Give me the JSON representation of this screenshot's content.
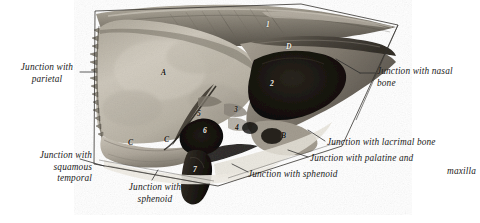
{
  "plate": {
    "title": "Ethmoid bone, lateral aspect",
    "caption_labels": [
      {
        "id": "junction-parietal",
        "text": "Junction with\nparietal"
      },
      {
        "id": "junction-squamous-temporal",
        "text": "Junction with\nsquamous\ntemporal"
      },
      {
        "id": "junction-sphenoid-bottom",
        "text": "Junction with\nsphenoid"
      },
      {
        "id": "junction-nasal-bone",
        "text": "Junction with nasal\nbone"
      },
      {
        "id": "junction-lacrimal-bone",
        "text": "Junction with lacrimal bone"
      },
      {
        "id": "junction-palatine-maxilla",
        "text": "Junction with palatine and"
      },
      {
        "id": "junction-palatine-maxilla-cont",
        "text": "maxilla"
      },
      {
        "id": "junction-sphenoid-right",
        "text": "Junction with sphenoid"
      }
    ],
    "markers": [
      {
        "id": "marker-A",
        "text": "A",
        "tone": "dark"
      },
      {
        "id": "marker-B",
        "text": "B",
        "tone": "dark"
      },
      {
        "id": "marker-C-left",
        "text": "C",
        "tone": "dark"
      },
      {
        "id": "marker-C-right",
        "text": "C",
        "tone": "dark"
      },
      {
        "id": "marker-D",
        "text": "D",
        "tone": "light"
      },
      {
        "id": "marker-1",
        "text": "1",
        "tone": "light"
      },
      {
        "id": "marker-2",
        "text": "2",
        "tone": "light"
      },
      {
        "id": "marker-3",
        "text": "3",
        "tone": "dark"
      },
      {
        "id": "marker-4",
        "text": "4",
        "tone": "dark"
      },
      {
        "id": "marker-5",
        "text": "5",
        "tone": "dark"
      },
      {
        "id": "marker-6",
        "text": "6",
        "tone": "light"
      },
      {
        "id": "marker-7",
        "text": "7",
        "tone": "light"
      }
    ],
    "colors": {
      "page_background": "#ffffff",
      "label_text": "#1b1b1b",
      "leader_line": "#2a2a2a",
      "bone_light": "#cfc9bd",
      "bone_mid": "#9d968a",
      "bone_shadow": "#4b463e",
      "cavity_dark": "#15120e",
      "frame_line": "#33312d"
    }
  }
}
